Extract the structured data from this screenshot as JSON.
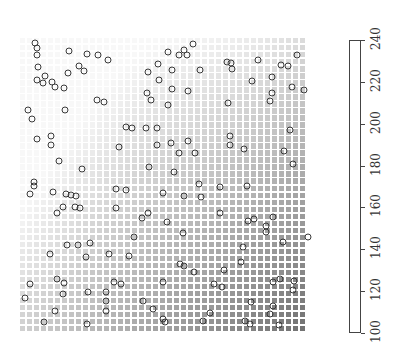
{
  "chart_data": {
    "type": "heatmap",
    "title": "",
    "xlabel": "",
    "ylabel": "",
    "grid": {
      "cols": 41,
      "rows": 42,
      "pixel_bounds": {
        "left": 20,
        "top": 38,
        "right": 307,
        "bottom": 333
      },
      "gradient": "value increases toward bottom-right; lightest near top-left/upper center"
    },
    "colorbar": {
      "ticks": [
        100,
        120,
        140,
        160,
        180,
        200,
        220,
        240
      ],
      "tick_labels": [
        "100",
        "120",
        "140",
        "160",
        "180",
        "200",
        "220",
        "240"
      ],
      "range": [
        100,
        240
      ],
      "orientation": "vertical",
      "label_rotation": -90
    },
    "scatter_points_px": [
      [
        35,
        43
      ],
      [
        37,
        48
      ],
      [
        37,
        55
      ],
      [
        38,
        67
      ],
      [
        37,
        80
      ],
      [
        45,
        76
      ],
      [
        43,
        83
      ],
      [
        52,
        82
      ],
      [
        55,
        87
      ],
      [
        69,
        51
      ],
      [
        87,
        54
      ],
      [
        98,
        55
      ],
      [
        108,
        60
      ],
      [
        68,
        73
      ],
      [
        79,
        66
      ],
      [
        84,
        71
      ],
      [
        64,
        88
      ],
      [
        97,
        100
      ],
      [
        104,
        102
      ],
      [
        65,
        110
      ],
      [
        28,
        110
      ],
      [
        32,
        119
      ],
      [
        37,
        139
      ],
      [
        51,
        136
      ],
      [
        51,
        145
      ],
      [
        59,
        161
      ],
      [
        82,
        169
      ],
      [
        119,
        147
      ],
      [
        126,
        127
      ],
      [
        132,
        128
      ],
      [
        157,
        128
      ],
      [
        146,
        128
      ],
      [
        168,
        105
      ],
      [
        172,
        89
      ],
      [
        148,
        72
      ],
      [
        158,
        64
      ],
      [
        172,
        70
      ],
      [
        168,
        52
      ],
      [
        179,
        55
      ],
      [
        184,
        50
      ],
      [
        179,
        153
      ],
      [
        149,
        167
      ],
      [
        157,
        145
      ],
      [
        174,
        172
      ],
      [
        34,
        182
      ],
      [
        126,
        190
      ],
      [
        151,
        100
      ],
      [
        147,
        93
      ],
      [
        171,
        143
      ],
      [
        159,
        80
      ],
      [
        193,
        44
      ],
      [
        187,
        55
      ],
      [
        227,
        62
      ],
      [
        231,
        63
      ],
      [
        232,
        69
      ],
      [
        200,
        70
      ],
      [
        258,
        60
      ],
      [
        281,
        65
      ],
      [
        288,
        66
      ],
      [
        297,
        55
      ],
      [
        252,
        81
      ],
      [
        272,
        77
      ],
      [
        292,
        87
      ],
      [
        304,
        90
      ],
      [
        188,
        91
      ],
      [
        272,
        93
      ],
      [
        270,
        101
      ],
      [
        228,
        103
      ],
      [
        188,
        141
      ],
      [
        230,
        136
      ],
      [
        230,
        145
      ],
      [
        244,
        149
      ],
      [
        195,
        153
      ],
      [
        290,
        130
      ],
      [
        284,
        151
      ],
      [
        293,
        164
      ],
      [
        199,
        184
      ],
      [
        247,
        186
      ],
      [
        34,
        186
      ],
      [
        30,
        194
      ],
      [
        53,
        192
      ],
      [
        66,
        194
      ],
      [
        71,
        195
      ],
      [
        76,
        196
      ],
      [
        63,
        207
      ],
      [
        57,
        213
      ],
      [
        75,
        207
      ],
      [
        80,
        208
      ],
      [
        116,
        189
      ],
      [
        163,
        193
      ],
      [
        116,
        208
      ],
      [
        142,
        218
      ],
      [
        148,
        213
      ],
      [
        167,
        222
      ],
      [
        134,
        237
      ],
      [
        67,
        245
      ],
      [
        78,
        245
      ],
      [
        90,
        243
      ],
      [
        50,
        254
      ],
      [
        86,
        257
      ],
      [
        109,
        254
      ],
      [
        129,
        256
      ],
      [
        180,
        264
      ],
      [
        163,
        282
      ],
      [
        57,
        279
      ],
      [
        64,
        283
      ],
      [
        30,
        284
      ],
      [
        25,
        298
      ],
      [
        63,
        294
      ],
      [
        114,
        282
      ],
      [
        121,
        284
      ],
      [
        88,
        292
      ],
      [
        106,
        292
      ],
      [
        55,
        311
      ],
      [
        106,
        301
      ],
      [
        106,
        311
      ],
      [
        44,
        322
      ],
      [
        87,
        324
      ],
      [
        143,
        301
      ],
      [
        153,
        309
      ],
      [
        163,
        319
      ],
      [
        165,
        322
      ],
      [
        184,
        196
      ],
      [
        201,
        197
      ],
      [
        220,
        187
      ],
      [
        220,
        213
      ],
      [
        248,
        221
      ],
      [
        254,
        219
      ],
      [
        273,
        217
      ],
      [
        266,
        226
      ],
      [
        266,
        232
      ],
      [
        283,
        242
      ],
      [
        308,
        237
      ],
      [
        243,
        247
      ],
      [
        241,
        262
      ],
      [
        183,
        233
      ],
      [
        184,
        266
      ],
      [
        194,
        272
      ],
      [
        224,
        270
      ],
      [
        214,
        284
      ],
      [
        222,
        287
      ],
      [
        294,
        281
      ],
      [
        293,
        290
      ],
      [
        273,
        282
      ],
      [
        280,
        279
      ],
      [
        251,
        302
      ],
      [
        273,
        306
      ],
      [
        270,
        314
      ],
      [
        210,
        313
      ],
      [
        245,
        321
      ],
      [
        250,
        324
      ],
      [
        279,
        325
      ],
      [
        203,
        321
      ]
    ],
    "legend": null,
    "grid_lines": false
  }
}
